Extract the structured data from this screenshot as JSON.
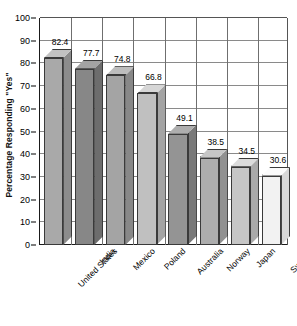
{
  "chart_data": {
    "type": "bar",
    "title": "",
    "subtitle": "",
    "xlabel": "",
    "ylabel": "Percentage Responding \"Yes\"",
    "ylim": [
      0,
      100
    ],
    "ytick_step": 10,
    "yticks": [
      100,
      90,
      80,
      70,
      60,
      50,
      40,
      30,
      20,
      10,
      0
    ],
    "grid": {
      "horizontal": true,
      "vertical": true,
      "legend_position": "none"
    },
    "style": "3d-column",
    "categories": [
      "United States",
      "India",
      "Mexico",
      "Poland",
      "Australia",
      "Norway",
      "Japan",
      "Sweden"
    ],
    "values": [
      82.4,
      77.7,
      74.8,
      66.8,
      49.1,
      38.5,
      34.5,
      30.6
    ],
    "value_labels": [
      "82.4",
      "77.7",
      "74.8",
      "66.8",
      "49.1",
      "38.5",
      "34.5",
      "30.6"
    ],
    "bar_colors": [
      "#a9a9a9",
      "#878787",
      "#a4a4a4",
      "#c0c0c0",
      "#949494",
      "#adadad",
      "#c6c6c6",
      "#f2f2f2"
    ],
    "bar_top_colors": [
      "#c2c2c2",
      "#a3a3a3",
      "#bdbdbd",
      "#d6d6d6",
      "#aeaeae",
      "#c6c6c6",
      "#dcdcdc",
      "#fbfbfb"
    ],
    "bar_side_colors": [
      "#8c8c8c",
      "#6d6d6d",
      "#888888",
      "#a4a4a4",
      "#797979",
      "#919191",
      "#aaaaaa",
      "#d8d8d8"
    ],
    "axis_color": "#1a1a1a",
    "grid_color": "#8a8a8a"
  }
}
